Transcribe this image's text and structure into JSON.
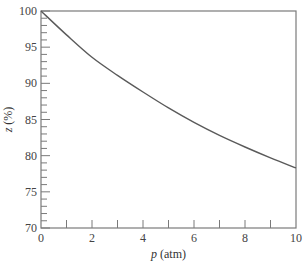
{
  "chart_data": {
    "type": "line",
    "title": "",
    "xlabel_var": "p",
    "xlabel_unit": " (atm)",
    "ylabel_var": "z",
    "ylabel_unit": " (%)",
    "xlim": [
      0,
      10
    ],
    "ylim": [
      70,
      100
    ],
    "x_major_ticks": [
      0,
      2,
      4,
      6,
      8,
      10
    ],
    "x_minor_ticks": [
      1,
      2,
      3,
      4,
      5,
      6,
      7,
      8,
      9
    ],
    "y_major_ticks": [
      70,
      75,
      80,
      85,
      90,
      95,
      100
    ],
    "y_minor_step": 1,
    "grid": false,
    "legend": null,
    "series": [
      {
        "name": "z vs p",
        "x": [
          0,
          1,
          2,
          3,
          4,
          5,
          6,
          7,
          8,
          9,
          10
        ],
        "values": [
          100,
          96.7,
          93.6,
          91.1,
          88.8,
          86.6,
          84.6,
          82.8,
          81.2,
          79.7,
          78.3
        ]
      }
    ],
    "colors": {
      "line": "#5a5a5a",
      "frame": "#7a7a7a",
      "text": "#444444"
    }
  }
}
